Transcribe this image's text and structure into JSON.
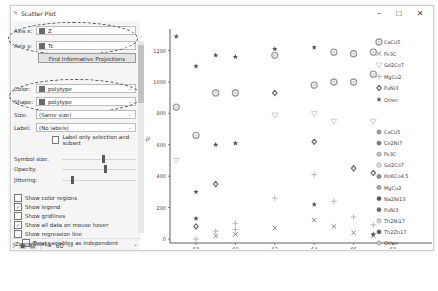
{
  "window": {
    "title": "Scatter Plot",
    "controls": {
      "minimize": "–",
      "maximize": "☐",
      "close": "✕"
    }
  },
  "panel": {
    "axis_x": {
      "label": "Axis x:",
      "value": "Z"
    },
    "axis_y": {
      "label": "Axis y:",
      "value": "Tc"
    },
    "find_projections": "Find Informative Projections",
    "color": {
      "label": "Color:",
      "value": "polytype"
    },
    "shape": {
      "label": "Shape:",
      "value": "polytype"
    },
    "size": {
      "label": "Size:",
      "value": "(Same size)"
    },
    "label": {
      "label": "Label:",
      "value": "(No labels)"
    },
    "label_only_selection": {
      "label": "Label only selection and subset",
      "checked": false
    },
    "symbol_size": {
      "label": "Symbol size:",
      "pos": 0.55
    },
    "opacity": {
      "label": "Opacity:",
      "pos": 0.58
    },
    "jittering": {
      "label": "Jittering:",
      "pos": 0.1
    },
    "checkboxes": [
      {
        "label": "Show color regions",
        "checked": false
      },
      {
        "label": "Show legend",
        "checked": true
      },
      {
        "label": "Show gridlines",
        "checked": false
      },
      {
        "label": "Show all data on mouse hover",
        "checked": true
      },
      {
        "label": "Show regression line",
        "checked": false
      }
    ],
    "treat_independent": {
      "label": "Treat variables as independent",
      "checked": false
    },
    "zoom_select": "Zoom/Select",
    "bottom": {
      "count": "60"
    }
  },
  "chart_data": {
    "type": "scatter",
    "title": "",
    "xlabel": "Z",
    "ylabel": "Tc",
    "x_ticks": [
      58,
      60,
      62,
      64,
      66,
      68
    ],
    "y_ticks": [
      0,
      200,
      400,
      600,
      800,
      1000,
      1200
    ],
    "xlim": [
      56.8,
      68.5
    ],
    "ylim": [
      -30,
      1330
    ],
    "grid": false,
    "legend_position": "right",
    "series": [
      {
        "name": "CaCu5",
        "marker": "circle",
        "points": [
          [
            57,
            840
          ],
          [
            58,
            660
          ],
          [
            59,
            930
          ],
          [
            60,
            930
          ],
          [
            62,
            1170
          ],
          [
            64,
            980
          ],
          [
            65,
            1000
          ],
          [
            66,
            1000
          ],
          [
            67,
            1050
          ],
          [
            65,
            1190
          ],
          [
            66,
            1180
          ],
          [
            67,
            1190
          ]
        ]
      },
      {
        "name": "Fe3C",
        "marker": "x",
        "points": [
          [
            59,
            20
          ],
          [
            60,
            30
          ],
          [
            62,
            70
          ],
          [
            64,
            120
          ],
          [
            65,
            80
          ],
          [
            66,
            40
          ],
          [
            67,
            20
          ]
        ]
      },
      {
        "name": "Gd2Co7",
        "marker": "triangle-down",
        "points": [
          [
            57,
            500
          ],
          [
            62,
            790
          ],
          [
            64,
            800
          ],
          [
            65,
            750
          ],
          [
            67,
            750
          ]
        ]
      },
      {
        "name": "MgCu2",
        "marker": "plus",
        "points": [
          [
            58,
            0
          ],
          [
            59,
            50
          ],
          [
            60,
            60
          ],
          [
            60,
            100
          ],
          [
            62,
            260
          ],
          [
            64,
            410
          ],
          [
            65,
            240
          ],
          [
            66,
            140
          ],
          [
            67,
            90
          ]
        ]
      },
      {
        "name": "PuNi3",
        "marker": "diamond",
        "points": [
          [
            58,
            80
          ],
          [
            59,
            350
          ],
          [
            62,
            930
          ],
          [
            64,
            620
          ],
          [
            66,
            450
          ],
          [
            67,
            420
          ]
        ]
      },
      {
        "name": "Other",
        "marker": "star",
        "points": [
          [
            57,
            1290
          ],
          [
            58,
            1100
          ],
          [
            58,
            300
          ],
          [
            58,
            130
          ],
          [
            59,
            1170
          ],
          [
            60,
            1160
          ],
          [
            59,
            600
          ],
          [
            60,
            610
          ],
          [
            62,
            1210
          ],
          [
            64,
            1220
          ],
          [
            64,
            220
          ],
          [
            67,
            30
          ]
        ]
      }
    ],
    "legend_groups": [
      [
        "CaCu5",
        "Fe3C",
        "Gd2Co7",
        "MgCu2",
        "PuNi3",
        "Other"
      ],
      [
        "CaCu5",
        "Ce2Ni7",
        "Fe3C",
        "Gd2Co7",
        "Ho6Co4.5",
        "MgCu2",
        "Na2Ni13",
        "PuNi3",
        "Th2Ni17",
        "Th2Zn17",
        "Other"
      ]
    ]
  }
}
